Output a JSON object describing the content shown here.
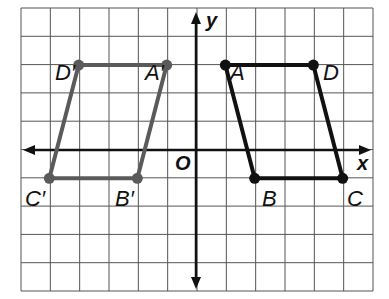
{
  "diagram": {
    "type": "coordinate-plane-reflection",
    "grid": {
      "x_min": -6,
      "x_max": 6,
      "y_min": -5,
      "y_max": 5,
      "left_px": 21,
      "right_px": 373,
      "top_px": 8,
      "bottom_px": 291,
      "origin_px": [
        196,
        150
      ],
      "line_color": "#555555"
    },
    "axes": {
      "x_label": "x",
      "y_label": "y",
      "origin_label": "O",
      "color": "#111111"
    },
    "shapes": [
      {
        "name": "ABCD",
        "color": "#111111",
        "points": [
          {
            "label": "A",
            "x": 1,
            "y": 3
          },
          {
            "label": "D",
            "x": 4,
            "y": 3
          },
          {
            "label": "C",
            "x": 5,
            "y": -1
          },
          {
            "label": "B",
            "x": 2,
            "y": -1
          }
        ]
      },
      {
        "name": "A'B'C'D'",
        "color": "#5a5a5a",
        "points": [
          {
            "label": "A'",
            "x": -1,
            "y": 3
          },
          {
            "label": "D'",
            "x": -4,
            "y": 3
          },
          {
            "label": "C'",
            "x": -5,
            "y": -1
          },
          {
            "label": "B'",
            "x": -2,
            "y": -1
          }
        ]
      }
    ],
    "labels": {
      "A": "A",
      "B": "B",
      "C": "C",
      "D": "D",
      "Ap": "A′",
      "Bp": "B′",
      "Cp": "C′",
      "Dp": "D′"
    }
  }
}
